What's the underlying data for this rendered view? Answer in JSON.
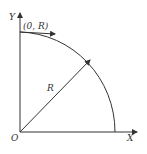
{
  "diagram": {
    "axes": {
      "x_label": "X",
      "y_label": "Y",
      "origin_label": "O"
    },
    "point_label": "(0, R)",
    "radius_label": "R",
    "colors": {
      "stroke": "#333333",
      "background": "#ffffff"
    }
  }
}
